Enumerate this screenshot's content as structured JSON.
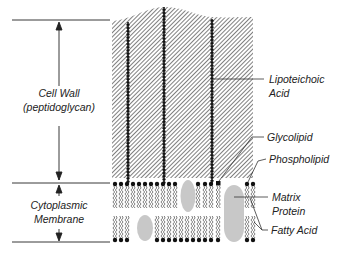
{
  "figure": {
    "type": "cross-section diagram"
  },
  "left_labels": {
    "cell_wall": {
      "line1": "Cell Wall",
      "line2": "(peptidoglycan)"
    },
    "membrane": {
      "line1": "Cytoplasmic",
      "line2": "Membrane"
    }
  },
  "right_labels": {
    "lipoteichoic": {
      "line1": "Lipoteichoic",
      "line2": "Acid"
    },
    "glycolipid": "Glycolipid",
    "phospholipid": "Phospholipid",
    "matrix_protein": {
      "line1": "Matrix",
      "line2": "Protein"
    },
    "fatty_acid": "Fatty Acid"
  },
  "colors": {
    "ink": "#1a1a1a",
    "hatch": "#3a3a3a",
    "protein": "#c8c8c8",
    "leader": "#333333"
  }
}
